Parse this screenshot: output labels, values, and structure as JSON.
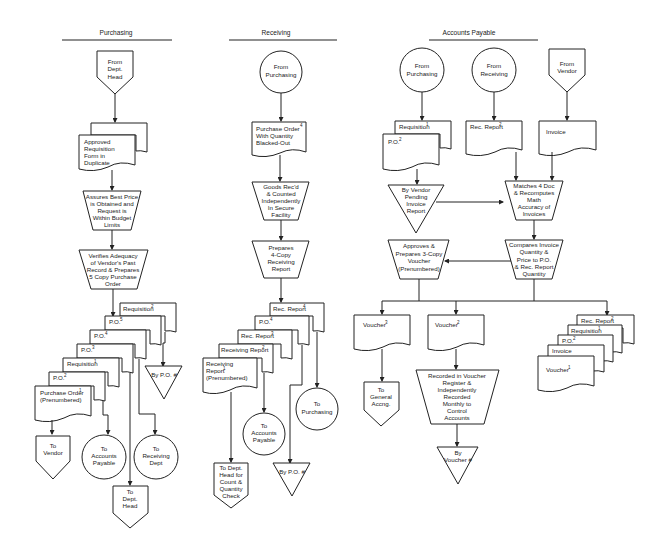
{
  "sections": [
    {
      "title": "Purchasing"
    },
    {
      "title": "Receiving"
    },
    {
      "title": "Accounts Payable"
    }
  ],
  "purchasing": {
    "start": [
      "From",
      "Dept.",
      "Head"
    ],
    "doc1": [
      "Approved",
      "Requisition",
      "Form in",
      "Duplicate"
    ],
    "proc1": [
      "Assures Best Price",
      "is Obtained and",
      "Request is",
      "Within Budget",
      "Limits"
    ],
    "proc2": [
      "Verifies Adequacy",
      "of Vendor's Past",
      "Record & Prepares",
      "5 Copy Purchase",
      "Order"
    ],
    "stack": [
      {
        "label": "Requisition",
        "sup": "2"
      },
      {
        "label": "P.O.",
        "sup": "5"
      },
      {
        "label": "P.O.",
        "sup": "4"
      },
      {
        "label": "P.O.",
        "sup": "3"
      },
      {
        "label": "Requisition",
        "sup": "1"
      },
      {
        "label": "P.O.",
        "sup": "2"
      },
      {
        "label": "Purchase Order",
        "sup": "1",
        "line2": "(Prenumbered)"
      }
    ],
    "file": [
      "By P.O. #"
    ],
    "outputs": {
      "vendor": [
        "To",
        "Vendor"
      ],
      "ap": [
        "To",
        "Accounts",
        "Payable"
      ],
      "receiving": [
        "To",
        "Receiving",
        "Dept"
      ],
      "dept_head": [
        "To",
        "Dept.",
        "Head"
      ]
    }
  },
  "receiving": {
    "start": [
      "From",
      "Purchasing"
    ],
    "doc1": {
      "lines": [
        "Purchase Order",
        "With Quantity",
        "Blacked-Out"
      ],
      "sup": "4"
    },
    "proc1": [
      "Goods Rec'd",
      "& Counted",
      "Independently",
      "In Secure",
      "Facility"
    ],
    "proc2": [
      "Prepares",
      "4-Copy",
      "Receiving",
      "Report"
    ],
    "stack": [
      {
        "label": "Rec. Report",
        "sup": "4"
      },
      {
        "label": "P.O.",
        "sup": "4"
      },
      {
        "label": "Rec. Report",
        "sup": "3"
      },
      {
        "label": "Receiving Report",
        "sup": "2"
      },
      {
        "label": "Receiving",
        "line2": "Report",
        "sup": "1",
        "line3": "(Prenumbered)"
      }
    ],
    "outputs": {
      "purchasing": [
        "To",
        "Purchasing"
      ],
      "ap": [
        "To",
        "Accounts",
        "Payable"
      ],
      "file": [
        "By P.O. #"
      ],
      "dept_head": [
        "To Dept.",
        "Head for",
        "Count &",
        "Quantity",
        "Check"
      ]
    }
  },
  "accounts_payable": {
    "start_purchasing": [
      "From",
      "Purchasing"
    ],
    "start_receiving": [
      "From",
      "Receiving"
    ],
    "start_vendor": [
      "From",
      "Vendor"
    ],
    "docs_purchasing": [
      {
        "label": "Requisition",
        "sup": "1"
      },
      {
        "label": "P.O.",
        "sup": "2"
      }
    ],
    "doc_receiving": {
      "label": "Rec. Report",
      "sup": "2"
    },
    "doc_vendor": {
      "label": "Invoice"
    },
    "file_pending": [
      "By Vendor",
      "Pending",
      "Invoice",
      "Report"
    ],
    "proc_match": [
      "Matches 4 Doc",
      "& Recomputes",
      "Math",
      "Accuracy of",
      "Invoices"
    ],
    "proc_voucher": [
      "Approves &",
      "Prepares 3-Copy",
      "Voucher",
      "(Prenumbered)"
    ],
    "proc_compare": [
      "Compares Invoice",
      "Quantity &",
      "Price to P.O.",
      "& Rec. Report",
      "Quantity"
    ],
    "voucher3": {
      "label": "Voucher",
      "sup": "3"
    },
    "voucher2": {
      "label": "Voucher",
      "sup": "2"
    },
    "to_gl": [
      "To",
      "General",
      "Accng."
    ],
    "proc_record": [
      "Recorded in Voucher",
      "Register &",
      "Independently",
      "Recorded",
      "Monthly to",
      "Control",
      "Accounts"
    ],
    "file_voucher": [
      "By",
      "Voucher #"
    ],
    "stack": [
      {
        "label": "Rec. Report",
        "sup": "2"
      },
      {
        "label": "Requisition",
        "sup": "1"
      },
      {
        "label": "P.O.",
        "sup": "2"
      },
      {
        "label": "Invoice"
      },
      {
        "label": "Voucher",
        "sup": "1"
      }
    ]
  }
}
